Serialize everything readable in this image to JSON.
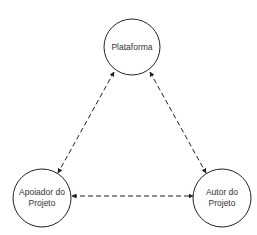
{
  "diagram": {
    "title": "",
    "nodes": [
      {
        "id": "plataforma",
        "lines": [
          "Plataforma"
        ],
        "cx": 132,
        "cy": 47,
        "r": 28
      },
      {
        "id": "apoiador",
        "lines": [
          "Apoiador do",
          "Projeto"
        ],
        "cx": 42,
        "cy": 198,
        "r": 29
      },
      {
        "id": "autor",
        "lines": [
          "Autor do",
          "Projeto"
        ],
        "cx": 222,
        "cy": 198,
        "r": 29
      }
    ],
    "edges": [
      {
        "from": "plataforma",
        "to": "apoiador",
        "style": "dashed",
        "direction": "bidirectional"
      },
      {
        "from": "plataforma",
        "to": "autor",
        "style": "dashed",
        "direction": "bidirectional"
      },
      {
        "from": "apoiador",
        "to": "autor",
        "style": "dashed",
        "direction": "bidirectional"
      }
    ],
    "colors": {
      "stroke": "#222222",
      "text": "#333333",
      "background": "#ffffff"
    }
  }
}
